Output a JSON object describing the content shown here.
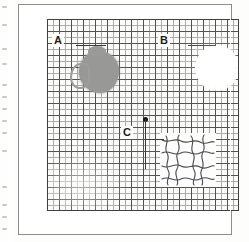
{
  "figure": {
    "kind": "amsler-grid-visual-field-chart",
    "background_color": "#fdfdfc",
    "frame_color": "#8d8d8d",
    "grid": {
      "minor_line_color": "#a9a9a9",
      "major_line_color": "#4b4b4b",
      "border_color": "#3f3f3f",
      "minor_spacing_px": 6,
      "major_spacing_px": 12,
      "columns": 32,
      "rows": 32
    },
    "fixation_point": {
      "name": "central fixation dot",
      "color": "#161616",
      "x_px": 124,
      "y_px": 112
    }
  },
  "annotations": [
    {
      "id": "A",
      "label": "A",
      "feature": "dense grey scotoma blob",
      "color": "#989896",
      "label_x_px": 52,
      "label_y_px": 40
    },
    {
      "id": "B",
      "label": "B",
      "feature": "blank washed-out area with missing grid lines",
      "color": "#ffffff",
      "label_x_px": 158,
      "label_y_px": 40
    },
    {
      "id": "C",
      "label": "C",
      "feature": "wavy distorted grid lines",
      "color": "#3a3a3a",
      "label_x_px": 122,
      "label_y_px": 127
    }
  ],
  "scan_margin": {
    "speck_offsets_y": [
      6,
      24,
      48,
      63,
      84,
      96,
      108,
      120,
      132,
      150,
      186,
      204,
      216,
      228
    ]
  }
}
